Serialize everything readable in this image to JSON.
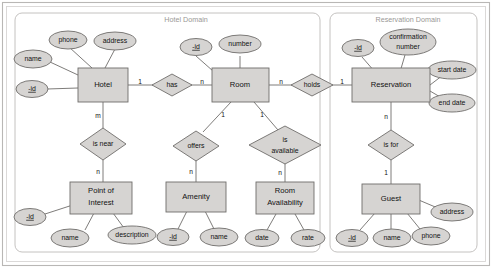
{
  "figure": {
    "type": "entity-relationship-diagram",
    "notation": "Chen",
    "background_color": "#ffffff",
    "shape_fill_color": "#d6d4d2",
    "shape_stroke_color": "#6f6d6b",
    "domain_box_stroke_color": "#bdbbb9",
    "domain_title_color": "#9a9896"
  },
  "domains": [
    {
      "id": "hotel-domain",
      "title": "Hotel Domain"
    },
    {
      "id": "reservation-domain",
      "title": "Reservation Domain"
    }
  ],
  "entities": [
    {
      "id": "hotel",
      "label": "Hotel",
      "domain": "hotel-domain"
    },
    {
      "id": "room",
      "label": "Room",
      "domain": "hotel-domain"
    },
    {
      "id": "point-of-interest",
      "label_line1": "Point of",
      "label_line2": "Interest",
      "label": "Point of Interest",
      "domain": "hotel-domain"
    },
    {
      "id": "amenity",
      "label": "Amenity",
      "domain": "hotel-domain"
    },
    {
      "id": "room-availability",
      "label_line1": "Room",
      "label_line2": "Availability",
      "label": "Room Availability",
      "domain": "hotel-domain"
    },
    {
      "id": "reservation",
      "label": "Reservation",
      "domain": "reservation-domain"
    },
    {
      "id": "guest",
      "label": "Guest",
      "domain": "reservation-domain"
    }
  ],
  "attributes": [
    {
      "id": "hotel-name",
      "entity": "hotel",
      "label": "name",
      "is_key": false
    },
    {
      "id": "hotel-phone",
      "entity": "hotel",
      "label": "phone",
      "is_key": false
    },
    {
      "id": "hotel-address",
      "entity": "hotel",
      "label": "address",
      "is_key": false
    },
    {
      "id": "hotel-id",
      "entity": "hotel",
      "label": "-id",
      "is_key": true
    },
    {
      "id": "room-id",
      "entity": "room",
      "label": "-id",
      "is_key": true
    },
    {
      "id": "room-number",
      "entity": "room",
      "label": "number",
      "is_key": false
    },
    {
      "id": "poi-id",
      "entity": "point-of-interest",
      "label": "-id",
      "is_key": true
    },
    {
      "id": "poi-name",
      "entity": "point-of-interest",
      "label": "name",
      "is_key": false
    },
    {
      "id": "poi-description",
      "entity": "point-of-interest",
      "label": "description",
      "is_key": false
    },
    {
      "id": "amenity-id",
      "entity": "amenity",
      "label": "-id",
      "is_key": true
    },
    {
      "id": "amenity-name",
      "entity": "amenity",
      "label": "name",
      "is_key": false
    },
    {
      "id": "ra-date",
      "entity": "room-availability",
      "label": "date",
      "is_key": false
    },
    {
      "id": "ra-rate",
      "entity": "room-availability",
      "label": "rate",
      "is_key": false
    },
    {
      "id": "reservation-id",
      "entity": "reservation",
      "label": "-id",
      "is_key": true
    },
    {
      "id": "reservation-confirmation-number",
      "entity": "reservation",
      "label_line1": "confirmation",
      "label_line2": "number",
      "label": "confirmation number",
      "is_key": false
    },
    {
      "id": "reservation-start-date",
      "entity": "reservation",
      "label": "start date",
      "is_key": false
    },
    {
      "id": "reservation-end-date",
      "entity": "reservation",
      "label": "end date",
      "is_key": false
    },
    {
      "id": "guest-id",
      "entity": "guest",
      "label": "-id",
      "is_key": true
    },
    {
      "id": "guest-name",
      "entity": "guest",
      "label": "name",
      "is_key": false
    },
    {
      "id": "guest-phone",
      "entity": "guest",
      "label": "phone",
      "is_key": false
    },
    {
      "id": "guest-address",
      "entity": "guest",
      "label": "address",
      "is_key": false
    }
  ],
  "relationships": [
    {
      "id": "has",
      "label": "has",
      "from_entity": "hotel",
      "to_entity": "room",
      "from_cardinality": "1",
      "to_cardinality": "n"
    },
    {
      "id": "is-near",
      "label": "is near",
      "from_entity": "hotel",
      "to_entity": "point-of-interest",
      "from_cardinality": "m",
      "to_cardinality": "n"
    },
    {
      "id": "offers",
      "label": "offers",
      "from_entity": "room",
      "to_entity": "amenity",
      "from_cardinality": "1",
      "to_cardinality": "n"
    },
    {
      "id": "is-available",
      "label_line1": "is",
      "label_line2": "available",
      "label": "is available",
      "from_entity": "room",
      "to_entity": "room-availability",
      "from_cardinality": "1",
      "to_cardinality": "n"
    },
    {
      "id": "holds",
      "label": "holds",
      "from_entity": "room",
      "to_entity": "reservation",
      "from_cardinality": "n",
      "to_cardinality": "1"
    },
    {
      "id": "is-for",
      "label": "is for",
      "from_entity": "reservation",
      "to_entity": "guest",
      "from_cardinality": "n",
      "to_cardinality": "1"
    }
  ]
}
